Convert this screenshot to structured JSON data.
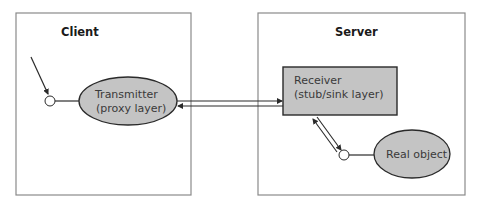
{
  "diagram": {
    "client": {
      "title": "Client",
      "transmitter": {
        "line1": "Transmitter",
        "line2": "(proxy layer)"
      }
    },
    "server": {
      "title": "Server",
      "receiver": {
        "line1": "Receiver",
        "line2": "(stub/sink layer)"
      },
      "real_object": {
        "label": "Real object"
      }
    },
    "colors": {
      "border": "#8a8a8a",
      "shape_fill": "#c4c4c4",
      "shape_stroke": "#2a2a2a",
      "line": "#2a2a2a"
    }
  }
}
